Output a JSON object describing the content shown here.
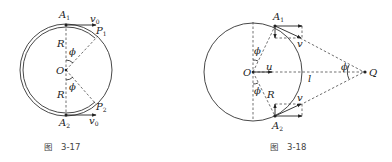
{
  "figures": [
    {
      "id": "fig-3-17",
      "caption_prefix": "图",
      "caption_number": "3-17",
      "labels": {
        "A1": "A",
        "A1_sub": "1",
        "A2": "A",
        "A2_sub": "2",
        "P1": "P",
        "P1_sub": "1",
        "P2": "P",
        "P2_sub": "2",
        "v0_top": "v",
        "v0_top_sub": "0",
        "v0_bottom": "v",
        "v0_bottom_sub": "0",
        "R_top": "R",
        "R_bottom": "R",
        "O": "O",
        "phi_top": "ϕ",
        "phi_bottom": "ϕ"
      }
    },
    {
      "id": "fig-3-18",
      "caption_prefix": "图",
      "caption_number": "3-18",
      "labels": {
        "A1": "A",
        "A1_sub": "1",
        "A2": "A",
        "A2_sub": "2",
        "O": "O",
        "Q": "Q",
        "u": "u",
        "l": "l",
        "R": "R",
        "v_top": "v",
        "v_bottom": "v",
        "phi_top": "ϕ",
        "phi_bottom": "ϕ",
        "phi_Q": "ϕ"
      }
    }
  ]
}
